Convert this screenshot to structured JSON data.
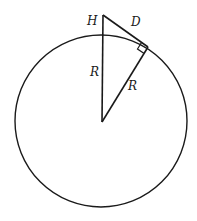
{
  "diagram": {
    "labels": {
      "height": "H",
      "distance": "D",
      "radius_vertical": "R",
      "radius_tangent": "R"
    },
    "colors": {
      "stroke": "#1a1a1a",
      "background": "#ffffff"
    }
  }
}
